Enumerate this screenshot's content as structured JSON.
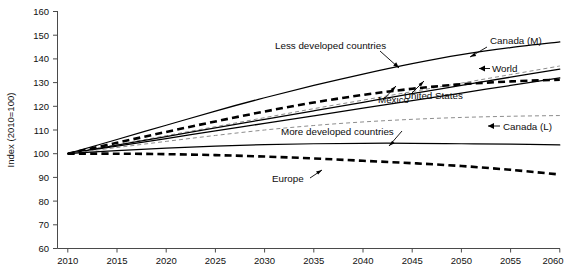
{
  "chart_data": {
    "type": "line",
    "title": "",
    "subtitle": "",
    "xlabel": "",
    "ylabel": "Index (2010=100)",
    "xlim": [
      2010,
      2060
    ],
    "ylim": [
      60,
      160
    ],
    "grid": false,
    "legend_position": "inline-annotations",
    "x": [
      2010,
      2015,
      2020,
      2025,
      2030,
      2035,
      2040,
      2045,
      2050,
      2055,
      2060
    ],
    "xticks": [
      "2010",
      "2015",
      "2020",
      "2025",
      "2030",
      "2035",
      "2040",
      "2045",
      "2050",
      "2055",
      "2060"
    ],
    "yticks": [
      "60",
      "70",
      "80",
      "90",
      "100",
      "110",
      "120",
      "130",
      "140",
      "150",
      "160"
    ],
    "series": [
      {
        "name": "Less developed countries",
        "style": "solid",
        "color": "#000000",
        "values": [
          100,
          106.0,
          112.0,
          118.0,
          123.6,
          128.8,
          133.6,
          138.0,
          141.8,
          144.8,
          147.2
        ]
      },
      {
        "name": "Canada (M)",
        "style": "dashed-light",
        "color": "#8d8d8d",
        "values": [
          100,
          103.8,
          107.6,
          111.4,
          115.2,
          119.0,
          122.6,
          126.2,
          129.8,
          133.4,
          137.0
        ]
      },
      {
        "name": "World",
        "style": "solid",
        "color": "#000000",
        "values": [
          100,
          103.6,
          107.2,
          110.9,
          114.5,
          118.1,
          121.7,
          125.3,
          128.8,
          132.3,
          135.7
        ]
      },
      {
        "name": "Mexico",
        "style": "dashed-heavy",
        "color": "#000000",
        "values": [
          100,
          104.6,
          109.2,
          113.6,
          117.8,
          121.6,
          124.8,
          127.4,
          129.3,
          130.5,
          131.2
        ]
      },
      {
        "name": "United States",
        "style": "solid",
        "color": "#000000",
        "values": [
          100,
          103.2,
          106.4,
          109.6,
          112.8,
          116.0,
          119.2,
          122.4,
          125.6,
          128.8,
          132.0
        ]
      },
      {
        "name": "Canada (L)",
        "style": "dashed-light",
        "color": "#8d8d8d",
        "values": [
          100,
          102.6,
          105.2,
          107.7,
          110.0,
          111.9,
          113.4,
          114.5,
          115.3,
          115.8,
          116.1
        ]
      },
      {
        "name": "More developed countries",
        "style": "solid",
        "color": "#000000",
        "values": [
          100,
          101.3,
          102.4,
          103.2,
          103.8,
          104.2,
          104.4,
          104.4,
          104.2,
          104.0,
          103.7
        ]
      },
      {
        "name": "Europe",
        "style": "dashed-heavy",
        "color": "#000000",
        "values": [
          100,
          100.0,
          99.8,
          99.4,
          98.8,
          98.0,
          97.0,
          96.0,
          94.8,
          93.2,
          91.2
        ]
      }
    ],
    "annotations": [
      {
        "text": "Less developed countries",
        "series": "Less developed countries"
      },
      {
        "text": "Canada (M)",
        "series": "Canada (M)"
      },
      {
        "text": "World",
        "series": "World"
      },
      {
        "text": "Mexico",
        "series": "Mexico"
      },
      {
        "text": "United States",
        "series": "United States"
      },
      {
        "text": "Canada (L)",
        "series": "Canada (L)"
      },
      {
        "text": "More developed countries",
        "series": "More developed countries"
      },
      {
        "text": "Europe",
        "series": "Europe"
      }
    ]
  }
}
